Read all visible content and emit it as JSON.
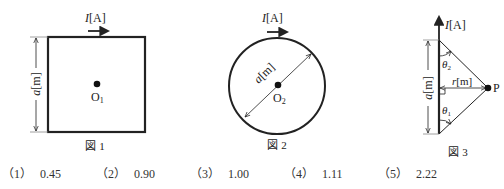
{
  "figures": [
    {
      "caption": "図 1",
      "shape": "square",
      "current_label": "I",
      "current_unit": "[A]",
      "dimension_label": "a",
      "dimension_unit": "[m]",
      "center_label": "O",
      "center_subscript": "1"
    },
    {
      "caption": "図 2",
      "shape": "circle",
      "current_label": "I",
      "current_unit": "[A]",
      "dimension_label": "a",
      "dimension_unit": "[m]",
      "center_label": "O",
      "center_subscript": "2"
    },
    {
      "caption": "図 3",
      "shape": "straight-wire",
      "current_label": "I",
      "current_unit": "[A]",
      "dimension_label": "a",
      "dimension_unit": "[m]",
      "distance_label": "r",
      "distance_unit": "[m]",
      "point_label": "P",
      "angle_top_label": "θ",
      "angle_top_subscript": "2",
      "angle_bottom_label": "θ",
      "angle_bottom_subscript": "1"
    }
  ],
  "answers": [
    {
      "number": "（1）",
      "value": "0.45"
    },
    {
      "number": "（2）",
      "value": "0.90"
    },
    {
      "number": "（3）",
      "value": "1.00"
    },
    {
      "number": "（4）",
      "value": "1.11"
    },
    {
      "number": "（5）",
      "value": "2.22"
    }
  ],
  "colors": {
    "line": "#222222",
    "background": "#ffffff"
  }
}
